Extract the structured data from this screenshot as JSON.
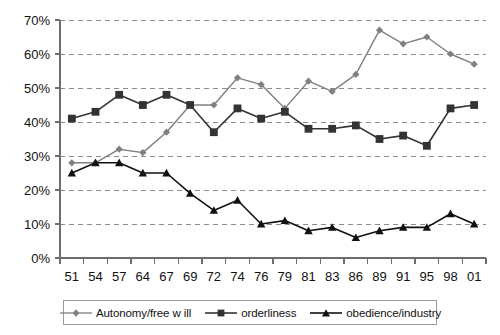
{
  "chart_data": {
    "type": "line",
    "title": "",
    "xlabel": "",
    "ylabel": "",
    "categories": [
      "51",
      "54",
      "57",
      "64",
      "67",
      "69",
      "72",
      "74",
      "76",
      "79",
      "81",
      "83",
      "86",
      "89",
      "91",
      "95",
      "98",
      "01"
    ],
    "ylim": [
      0,
      70
    ],
    "ytick_labels": [
      "0%",
      "10%",
      "20%",
      "30%",
      "40%",
      "50%",
      "60%",
      "70%"
    ],
    "ytick_values": [
      0,
      10,
      20,
      30,
      40,
      50,
      60,
      70
    ],
    "grid": "horizontal-dashed",
    "legend_position": "bottom",
    "series": [
      {
        "name": "Autonomy/free w ill",
        "marker": "diamond",
        "color": "#808080",
        "values": [
          28,
          28,
          32,
          31,
          37,
          45,
          45,
          53,
          51,
          44,
          52,
          49,
          54,
          67,
          63,
          65,
          60,
          57
        ]
      },
      {
        "name": "orderliness",
        "marker": "square",
        "color": "#333333",
        "values": [
          41,
          43,
          48,
          45,
          48,
          45,
          37,
          44,
          41,
          43,
          38,
          38,
          39,
          35,
          36,
          33,
          44,
          45
        ]
      },
      {
        "name": "obedience/industry",
        "marker": "triangle",
        "color": "#111111",
        "values": [
          25,
          28,
          28,
          25,
          25,
          19,
          14,
          17,
          10,
          11,
          8,
          9,
          6,
          8,
          9,
          9,
          13,
          10
        ]
      }
    ]
  },
  "legend": {
    "entries": [
      {
        "label": "Autonomy/free w ill"
      },
      {
        "label": "orderliness"
      },
      {
        "label": "obedience/industry"
      }
    ]
  }
}
